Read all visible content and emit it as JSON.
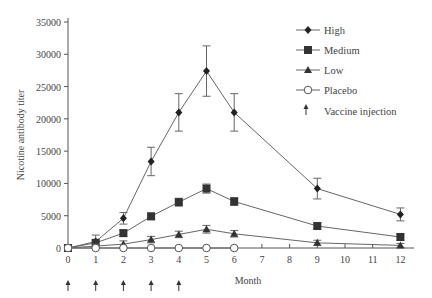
{
  "chart_data": {
    "type": "line",
    "title": "",
    "xlabel": "Month",
    "ylabel": "Nicotine antibody titer",
    "xlim": [
      0,
      12.5
    ],
    "ylim": [
      0,
      35000
    ],
    "x_ticks": [
      0,
      1,
      2,
      3,
      4,
      5,
      6,
      7,
      8,
      9,
      10,
      11,
      12
    ],
    "y_ticks": [
      0,
      5000,
      10000,
      15000,
      20000,
      25000,
      30000,
      35000
    ],
    "grid": false,
    "legend_position": "upper right",
    "series": [
      {
        "name": "High",
        "marker": "diamond",
        "x": [
          0,
          1,
          2,
          3,
          4,
          5,
          6,
          9,
          12
        ],
        "values": [
          0,
          1000,
          4600,
          13400,
          21000,
          27400,
          21000,
          9200,
          5200
        ],
        "err": [
          0,
          1000,
          900,
          2200,
          2900,
          3900,
          2900,
          1600,
          1000
        ]
      },
      {
        "name": "Medium",
        "marker": "square",
        "x": [
          0,
          1,
          2,
          3,
          4,
          5,
          6,
          9,
          12
        ],
        "values": [
          0,
          800,
          2300,
          4900,
          7100,
          9200,
          7200,
          3400,
          1700
        ],
        "err": [
          0,
          300,
          500,
          500,
          600,
          700,
          600,
          500,
          500
        ]
      },
      {
        "name": "Low",
        "marker": "triangle",
        "x": [
          0,
          1,
          2,
          3,
          4,
          5,
          6,
          9,
          12
        ],
        "values": [
          0,
          300,
          600,
          1300,
          2100,
          2900,
          2200,
          800,
          400
        ],
        "err": [
          0,
          300,
          500,
          500,
          500,
          600,
          500,
          400,
          300
        ]
      },
      {
        "name": "Placebo",
        "marker": "open-circle",
        "x": [
          0,
          1,
          2,
          3,
          4,
          5,
          6
        ],
        "values": [
          0,
          0,
          0,
          0,
          0,
          0,
          0
        ],
        "err": [
          0,
          0,
          0,
          0,
          0,
          0,
          0
        ]
      }
    ],
    "annotations": {
      "vaccine_injection_months": [
        0,
        1,
        2,
        3,
        4
      ],
      "vaccine_injection_label": "Vaccine injection"
    }
  },
  "legend": {
    "items": [
      "High",
      "Medium",
      "Low",
      "Placebo",
      "Vaccine injection"
    ]
  }
}
